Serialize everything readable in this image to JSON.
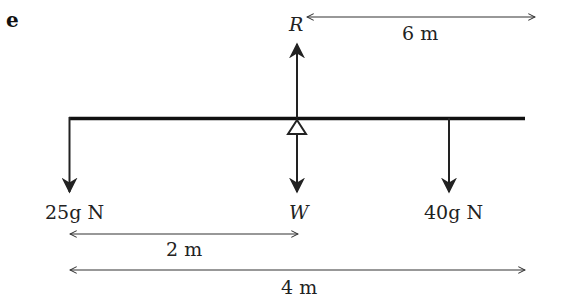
{
  "part_label": "e",
  "forces": {
    "reaction": "R",
    "weight": "W",
    "left_load": "25g N",
    "right_load": "40g N"
  },
  "dimensions": {
    "top": "6 m",
    "middle": "2 m",
    "bottom": "4 m"
  }
}
